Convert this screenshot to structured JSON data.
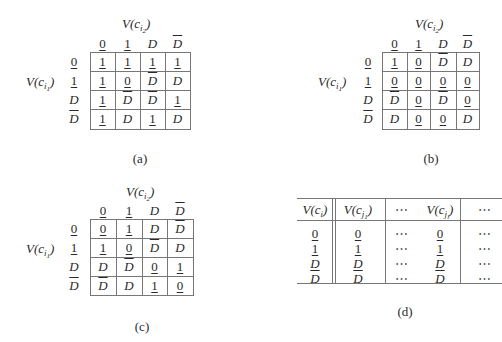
{
  "figures": [
    {
      "id": "a",
      "caption": "(a)",
      "col_label": {
        "base": "V(c",
        "sub": "i",
        "subsub": "2",
        "close": ")"
      },
      "row_label": {
        "base": "V(c",
        "sub": "i",
        "subsub": "1",
        "close": ")"
      },
      "col_headers": [
        "0",
        "1",
        "D",
        "D̄"
      ],
      "row_headers": [
        "0",
        "1",
        "D",
        "D̄"
      ],
      "cells": [
        [
          "1",
          "1",
          "1",
          "1"
        ],
        [
          "1",
          "0",
          "D̄",
          "D"
        ],
        [
          "1",
          "D̄",
          "D̄",
          "1"
        ],
        [
          "1",
          "D",
          "1",
          "D"
        ]
      ]
    },
    {
      "id": "b",
      "caption": "(b)",
      "col_label": {
        "base": "V(c",
        "sub": "i",
        "subsub": "2",
        "close": ")"
      },
      "row_label": {
        "base": "V(c",
        "sub": "i",
        "subsub": "1",
        "close": ")"
      },
      "col_headers": [
        "0",
        "1",
        "D",
        "D̄"
      ],
      "row_headers": [
        "0",
        "1",
        "D",
        "D̄"
      ],
      "cells": [
        [
          "1",
          "0",
          "D̄",
          "D"
        ],
        [
          "0",
          "0",
          "0",
          "0"
        ],
        [
          "D̄",
          "0",
          "D̄",
          "0"
        ],
        [
          "D",
          "0",
          "0",
          "D"
        ]
      ]
    },
    {
      "id": "c",
      "caption": "(c)",
      "col_label": {
        "base": "V(c",
        "sub": "i",
        "subsub": "2",
        "close": ")"
      },
      "row_label": {
        "base": "V(c",
        "sub": "i",
        "subsub": "1",
        "close": ")"
      },
      "col_headers": [
        "0",
        "1",
        "D",
        "D̄"
      ],
      "row_headers": [
        "0",
        "1",
        "D",
        "D̄"
      ],
      "cells": [
        [
          "0",
          "1",
          "D",
          "D̄"
        ],
        [
          "1",
          "0",
          "D̄",
          "D"
        ],
        [
          "D",
          "D̄",
          "0",
          "1"
        ],
        [
          "D̄",
          "D",
          "1",
          "0"
        ]
      ]
    }
  ],
  "table_d": {
    "caption": "(d)",
    "headers": [
      {
        "base": "V(c",
        "sub": "i",
        "subsub": "",
        "close": ")"
      },
      {
        "base": "V(c",
        "sub": "j",
        "subsub": "1",
        "close": ")"
      },
      {
        "base": "⋯",
        "sub": "",
        "subsub": "",
        "close": ""
      },
      {
        "base": "V(c",
        "sub": "j",
        "subsub": "l",
        "close": ")"
      },
      {
        "base": "⋯",
        "sub": "",
        "subsub": "",
        "close": ""
      }
    ],
    "rows": [
      [
        "0",
        "0",
        "⋯",
        "0",
        "⋯"
      ],
      [
        "1",
        "1",
        "⋯",
        "1",
        "⋯"
      ],
      [
        "D",
        "D",
        "⋯",
        "D",
        "⋯"
      ],
      [
        "D̄",
        "D̄",
        "⋯",
        "D̄",
        "⋯"
      ]
    ]
  }
}
